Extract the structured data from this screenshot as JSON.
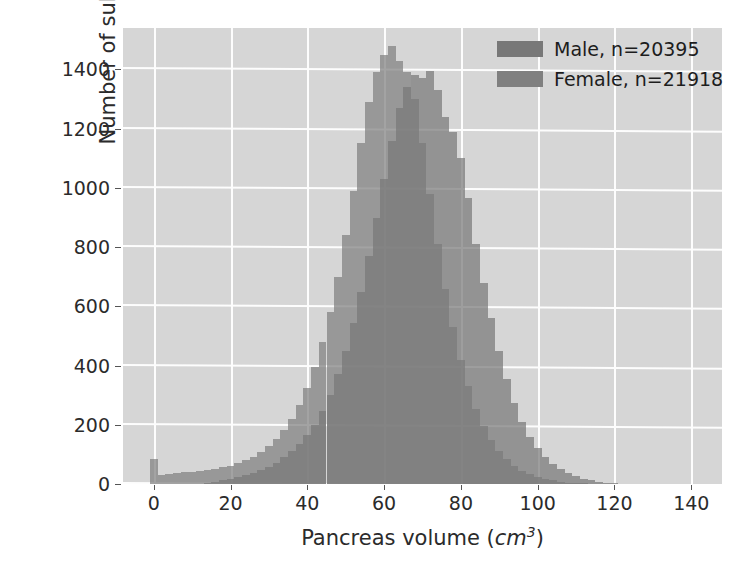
{
  "chart_data": {
    "type": "bar",
    "subtype": "overlapping-histogram",
    "title": "",
    "xlabel_text": "Pancreas volume (",
    "xlabel_unit": "cm",
    "xlabel_unit_sup": "3",
    "xlabel_tail": ")",
    "xlabel_full": "Pancreas volume (cm3)",
    "ylabel": "Number of subjects",
    "xlim": [
      -8,
      148
    ],
    "ylim": [
      0,
      1540
    ],
    "xticks": [
      0,
      20,
      40,
      60,
      80,
      100,
      120,
      140
    ],
    "yticks": [
      0,
      200,
      400,
      600,
      800,
      1000,
      1200,
      1400
    ],
    "grid": true,
    "legend_position": "upper right",
    "bin_width": 2,
    "bin_centers": [
      0,
      2,
      4,
      6,
      8,
      10,
      12,
      14,
      16,
      18,
      20,
      22,
      24,
      26,
      28,
      30,
      32,
      34,
      36,
      38,
      40,
      42,
      44,
      46,
      48,
      50,
      52,
      54,
      56,
      58,
      60,
      62,
      64,
      66,
      68,
      70,
      72,
      74,
      76,
      78,
      80,
      82,
      84,
      86,
      88,
      90,
      92,
      94,
      96,
      98,
      100,
      102,
      104,
      106,
      108,
      110,
      112,
      114,
      116,
      118,
      120,
      122,
      124,
      126
    ],
    "series": [
      {
        "name": "Male",
        "label": "Male, n=20395",
        "count": 20395,
        "color": "#787878",
        "values": [
          0,
          0,
          0,
          0,
          0,
          0,
          0,
          5,
          8,
          12,
          18,
          24,
          30,
          38,
          46,
          58,
          72,
          90,
          110,
          135,
          165,
          200,
          245,
          300,
          370,
          450,
          545,
          650,
          770,
          900,
          1030,
          1160,
          1270,
          1340,
          1380,
          1370,
          1395,
          1330,
          1240,
          1190,
          1100,
          965,
          810,
          680,
          560,
          450,
          355,
          275,
          210,
          160,
          120,
          90,
          68,
          50,
          36,
          26,
          18,
          12,
          8,
          5,
          3,
          1,
          0,
          0
        ]
      },
      {
        "name": "Female",
        "label": "Female, n=21918",
        "count": 21918,
        "color": "#808080",
        "values": [
          85,
          30,
          35,
          38,
          40,
          42,
          45,
          48,
          52,
          56,
          62,
          70,
          80,
          92,
          108,
          128,
          152,
          182,
          220,
          268,
          325,
          395,
          480,
          580,
          700,
          840,
          990,
          1150,
          1290,
          1390,
          1450,
          1480,
          1430,
          1390,
          1300,
          1150,
          980,
          810,
          660,
          530,
          420,
          330,
          255,
          195,
          150,
          112,
          85,
          62,
          45,
          33,
          24,
          17,
          12,
          8,
          5,
          3,
          2,
          1,
          0,
          0,
          0,
          0,
          0,
          0
        ]
      }
    ]
  },
  "legend": {
    "items": [
      {
        "label": "Male, n=20395",
        "swatch": "male"
      },
      {
        "label": "Female, n=21918",
        "swatch": "female"
      }
    ]
  },
  "colors": {
    "plot_background": "#d6d6d6",
    "gridline": "#fdfdfd",
    "male": "#787878",
    "female": "#808080",
    "overlap": "#6e6e6e",
    "text": "#2b2b2b",
    "figure_background": "#ffffff"
  }
}
